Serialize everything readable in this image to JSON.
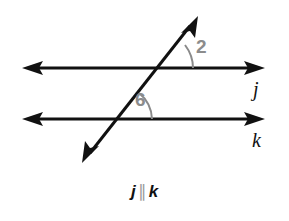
{
  "figure": {
    "type": "geometry-diagram",
    "background_color": "#ffffff",
    "line_color": "#111111",
    "angle_mark_color": "#8c8c8c",
    "lines": [
      {
        "name": "line-j",
        "label": "j",
        "orientation": "horizontal",
        "y": 68,
        "x_start": 22,
        "x_end": 265,
        "arrowheads": "both",
        "label_x": 253,
        "label_y": 79
      },
      {
        "name": "line-k",
        "label": "k",
        "orientation": "horizontal",
        "y": 119,
        "x_start": 22,
        "x_end": 265,
        "arrowheads": "both",
        "label_x": 252,
        "label_y": 130
      },
      {
        "name": "transversal",
        "label": "",
        "orientation": "diagonal",
        "x_start": 84,
        "y_start": 161,
        "x_end": 196,
        "y_end": 18,
        "arrowheads": "both"
      }
    ],
    "angles": [
      {
        "name": "angle-2",
        "label": "2",
        "vertex_x": 155,
        "vertex_y": 68,
        "arc_radius": 30,
        "position": "above-right of upper intersection",
        "label_x": 196,
        "label_y": 37
      },
      {
        "name": "angle-6",
        "label": "6",
        "vertex_x": 117,
        "vertex_y": 119,
        "arc_radius": 30,
        "position": "above-right of lower intersection",
        "label_x": 135,
        "label_y": 90
      }
    ],
    "caption": {
      "left_var": "j",
      "symbol": "∥",
      "right_var": "k",
      "full_text": "j ∥ k"
    }
  }
}
